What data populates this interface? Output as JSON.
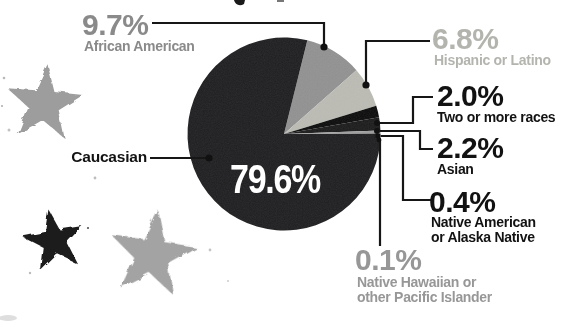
{
  "styles": {
    "background": "#ffffff",
    "leader_line_color": "#161616",
    "dot_color": "#111111",
    "inside_label_color": "#ffffff"
  },
  "chart_data": {
    "type": "pie",
    "title": "",
    "unit": "percent",
    "direction": "clockwise",
    "start_angle_deg": 14,
    "legend_position": "callouts-around-pie",
    "slices": [
      {
        "label": "African American",
        "value": 9.7,
        "color": "#8f8f8f",
        "label_color": "#8a8a8a"
      },
      {
        "label": "Hispanic or Latino",
        "value": 6.8,
        "color": "#b9b9b2",
        "label_color": "#b4b4af"
      },
      {
        "label": "Two or more races",
        "value": 2.0,
        "color": "#0b0b0b",
        "label_color": "#121212"
      },
      {
        "label": "Asian",
        "value": 2.2,
        "color": "#1a1a1a",
        "label_color": "#121212"
      },
      {
        "label": "Native American or Alaska Native",
        "value": 0.4,
        "color": "#9b9b9b",
        "label_color": "#121212"
      },
      {
        "label": "Native Hawaiian or other Pacific Islander",
        "value": 0.1,
        "color": "#c4c4c4",
        "label_color": "#979797"
      },
      {
        "label": "Caucasian",
        "value": 79.6,
        "color": "#1d1d1f",
        "label_color": "#121212"
      }
    ]
  },
  "callouts": {
    "african_american": {
      "pct": "9.7%",
      "lines": [
        "African American"
      ]
    },
    "hispanic_or_latino": {
      "pct": "6.8%",
      "lines": [
        "Hispanic or Latino"
      ]
    },
    "two_or_more_races": {
      "pct": "2.0%",
      "lines": [
        "Two or more races"
      ]
    },
    "asian": {
      "pct": "2.2%",
      "lines": [
        "Asian"
      ]
    },
    "native_american": {
      "pct": "0.4%",
      "lines": [
        "Native American",
        "or Alaska Native"
      ]
    },
    "native_hawaiian": {
      "pct": "0.1%",
      "lines": [
        "Native Hawaiian or",
        "other Pacific Islander"
      ]
    },
    "caucasian": {
      "pct": "79.6%",
      "label": "Caucasian"
    }
  },
  "decor": {
    "stars": [
      {
        "name": "gray-star-upper-left",
        "color": "#9d9d9d"
      },
      {
        "name": "black-star-lower-left",
        "color": "#1f1f1f"
      },
      {
        "name": "gray-star-lower-center",
        "color": "#a3a3a3"
      }
    ]
  }
}
